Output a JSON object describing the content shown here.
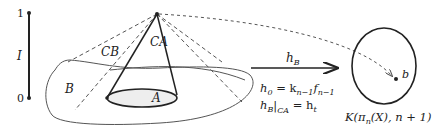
{
  "interval": {
    "top_label": "1",
    "bottom_label": "0",
    "name": "I"
  },
  "labels": {
    "cone_base": "CB",
    "cone_a": "CA",
    "region_b": "B",
    "disk_a": "A",
    "point_b": "b"
  },
  "arrow": {
    "label": "h",
    "label_sub": "B"
  },
  "equations": {
    "line1_lhs": "h",
    "line1_lhs_sub": "0",
    "line1_eq": " = k",
    "line1_k_sub": "n−1",
    "line1_f": "f",
    "line1_f_sub": "n−1",
    "line2_lhs": "h",
    "line2_lhs_sub": "B",
    "line2_restrict_sub": "CA",
    "line2_eq": " = h",
    "line2_rhs_sub": "t"
  },
  "target_space": {
    "label": "K(π",
    "label_sub": "n",
    "label_rest": "(X), n + 1)"
  },
  "colors": {
    "stroke": "#222222",
    "dashed": "#555555",
    "fill_disk": "#eeeeee"
  }
}
